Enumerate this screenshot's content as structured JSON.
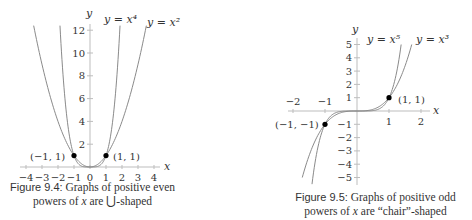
{
  "figures": [
    {
      "label": "Figure 9.4:",
      "caption_line1": "Graphs of positive even",
      "caption_line2_pre": "powers of",
      "caption_var": "x",
      "caption_line2_mid": "are",
      "caption_symbol": "⋃",
      "caption_line2_post": "-shaped",
      "axis_labels": {
        "x": "x",
        "y": "y"
      },
      "curve_labels": [
        "y = x⁴",
        "y = x²"
      ],
      "points": [
        "(−1, 1)",
        "(1, 1)"
      ],
      "x_ticks": [
        "−4",
        "−3",
        "−2",
        "−1",
        "0",
        "1",
        "2",
        "3",
        "4"
      ],
      "y_ticks": [
        "2",
        "4",
        "6",
        "8",
        "10",
        "12"
      ]
    },
    {
      "label": "Figure 9.5:",
      "caption_line1": "Graphs of positive odd",
      "caption_line2_pre": "powers of",
      "caption_var": "x",
      "caption_line2_mid": "are",
      "caption_line2_post": "“chair”-shaped",
      "axis_labels": {
        "x": "x",
        "y": "y"
      },
      "curve_labels": [
        "y = x⁵",
        "y = x³"
      ],
      "points": [
        "(−1, −1)",
        "(1, 1)"
      ],
      "x_ticks": [
        "−2",
        "−1",
        "1",
        "2"
      ],
      "y_ticks": [
        "5",
        "4",
        "3",
        "2",
        "1",
        "−1",
        "−2",
        "−3",
        "−4",
        "−5"
      ]
    }
  ],
  "chart_data": [
    {
      "type": "line",
      "title": "Graphs of positive even powers of x are ⋃-shaped",
      "xlabel": "x",
      "ylabel": "y",
      "xlim": [
        -4,
        4
      ],
      "ylim": [
        0,
        12
      ],
      "grid": false,
      "x_ticks": [
        -4,
        -3,
        -2,
        -1,
        0,
        1,
        2,
        3,
        4
      ],
      "y_ticks": [
        2,
        4,
        6,
        8,
        10,
        12
      ],
      "series": [
        {
          "name": "y = x^4",
          "function": "x^4",
          "x": [
            -1.86,
            -1.5,
            -1,
            -0.5,
            0,
            0.5,
            1,
            1.5,
            1.86
          ],
          "values": [
            12,
            5.06,
            1,
            0.06,
            0,
            0.06,
            1,
            5.06,
            12
          ]
        },
        {
          "name": "y = x^2",
          "function": "x^2",
          "x": [
            -3.46,
            -3,
            -2,
            -1,
            0,
            1,
            2,
            3,
            3.46
          ],
          "values": [
            12,
            9,
            4,
            1,
            0,
            1,
            4,
            9,
            12
          ]
        }
      ],
      "annotations": [
        {
          "x": -1,
          "y": 1,
          "text": "(−1, 1)"
        },
        {
          "x": 1,
          "y": 1,
          "text": "(1, 1)"
        }
      ]
    },
    {
      "type": "line",
      "title": "Graphs of positive odd powers of x are “chair”-shaped",
      "xlabel": "x",
      "ylabel": "y",
      "xlim": [
        -2,
        2
      ],
      "ylim": [
        -5,
        5
      ],
      "grid": false,
      "x_ticks": [
        -2,
        -1,
        1,
        2
      ],
      "y_ticks": [
        -5,
        -4,
        -3,
        -2,
        -1,
        1,
        2,
        3,
        4,
        5
      ],
      "series": [
        {
          "name": "y = x^5",
          "function": "x^5",
          "x": [
            -1.38,
            -1,
            -0.5,
            0,
            0.5,
            1,
            1.38
          ],
          "values": [
            -5,
            -1,
            -0.03,
            0,
            0.03,
            1,
            5
          ]
        },
        {
          "name": "y = x^3",
          "function": "x^3",
          "x": [
            -1.71,
            -1,
            -0.5,
            0,
            0.5,
            1,
            1.71
          ],
          "values": [
            -5,
            -1,
            -0.125,
            0,
            0.125,
            1,
            5
          ]
        }
      ],
      "annotations": [
        {
          "x": -1,
          "y": -1,
          "text": "(−1, −1)"
        },
        {
          "x": 1,
          "y": 1,
          "text": "(1, 1)"
        }
      ]
    }
  ]
}
